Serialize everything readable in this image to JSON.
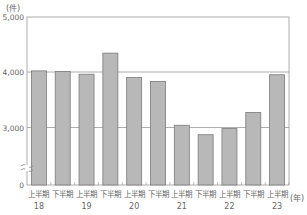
{
  "chart_data": {
    "type": "bar",
    "title": "",
    "ylabel": "(件)",
    "xlabel": "(年)",
    "ylim": [
      0,
      5000
    ],
    "axis_break": true,
    "grid": true,
    "gridlines": [
      3000,
      4000
    ],
    "yticks": [
      {
        "value": 0,
        "label": "0"
      },
      {
        "value": 3000,
        "label": "3,000"
      },
      {
        "value": 4000,
        "label": "4,000"
      },
      {
        "value": 5000,
        "label": "5,000"
      }
    ],
    "categories": [
      "上半期 18",
      "下半期 18",
      "上半期 19",
      "下半期 19",
      "上半期 20",
      "下半期 20",
      "上半期 21",
      "下半期 21",
      "上半期 22",
      "下半期 22",
      "上半期 23"
    ],
    "half_labels": [
      "上半期",
      "下半期",
      "上半期",
      "下半期",
      "上半期",
      "下半期",
      "上半期",
      "下半期",
      "上半期",
      "下半期",
      "上半期"
    ],
    "year_labels": [
      "18",
      "",
      "19",
      "",
      "20",
      "",
      "21",
      "",
      "22",
      "",
      "23"
    ],
    "values": [
      4020,
      4010,
      3960,
      4340,
      3900,
      3830,
      3040,
      2870,
      2980,
      3270,
      3950
    ],
    "bar_color": "#b8b8b8",
    "bar_border": "#7a7a7a",
    "legend": null
  }
}
